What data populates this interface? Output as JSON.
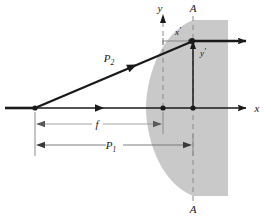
{
  "figure": {
    "type": "optics-ray-diagram",
    "caption": "",
    "colors": {
      "line": "#1a1a1a",
      "dimension_line": "#9a9a9a",
      "lens_fill": "#c9c9c9",
      "background": "#ffffff",
      "dashed": "#8a8a8a",
      "caption": "#8d8d8d"
    },
    "labels": [
      {
        "name": "y-axis-label",
        "text": "y",
        "prime": "",
        "sub": "",
        "x": 163,
        "y": 12
      },
      {
        "name": "x-axis-label",
        "text": "x",
        "prime": "",
        "sub": "",
        "x": 257,
        "y": 112
      },
      {
        "name": "plane-label-top",
        "text": "A",
        "prime": "",
        "sub": "",
        "x": 193,
        "y": 12
      },
      {
        "name": "plane-label-bottom",
        "text": "A",
        "prime": "",
        "sub": "",
        "x": 193,
        "y": 211
      },
      {
        "name": "x-prime-axis-label",
        "text": "x",
        "prime": "'",
        "sub": "",
        "x": 180,
        "y": 34
      },
      {
        "name": "y-prime-axis-label",
        "text": "y",
        "prime": "'",
        "sub": "",
        "x": 198,
        "y": 54
      },
      {
        "name": "ray-p2-label",
        "text": "P",
        "prime": "",
        "sub": "2",
        "x": 112,
        "y": 62
      },
      {
        "name": "focal-length-label",
        "text": "f",
        "prime": "",
        "sub": "",
        "x": 97,
        "y": 128
      },
      {
        "name": "distance-p1-label",
        "text": "P",
        "prime": "",
        "sub": "1",
        "x": 113,
        "y": 149
      }
    ],
    "dimensions": [
      {
        "name": "focal-length-dimension",
        "label": "f",
        "sub": "",
        "from_x": 35,
        "to_x": 163,
        "y": 124
      },
      {
        "name": "distance-p1-dimension",
        "label": "P",
        "sub": "1",
        "from_x": 35,
        "to_x": 193,
        "y": 145
      }
    ],
    "geometry": {
      "optical_axis_y": 108,
      "axis_start_x": 5,
      "axis_end_x": 250,
      "vertex_x": 35,
      "y_axis_x": 163,
      "plane_A_x": 193,
      "ray_height_y": 41,
      "lens_right_edge_x": 228,
      "lens_top_y": 20,
      "lens_bottom_y": 196
    },
    "points": [
      {
        "name": "source-point",
        "x": 35,
        "y": 108
      },
      {
        "name": "focal-point",
        "x": 163,
        "y": 108
      },
      {
        "name": "principal-point",
        "x": 193,
        "y": 108
      },
      {
        "name": "ray-intersection",
        "x": 193,
        "y": 41
      }
    ]
  }
}
